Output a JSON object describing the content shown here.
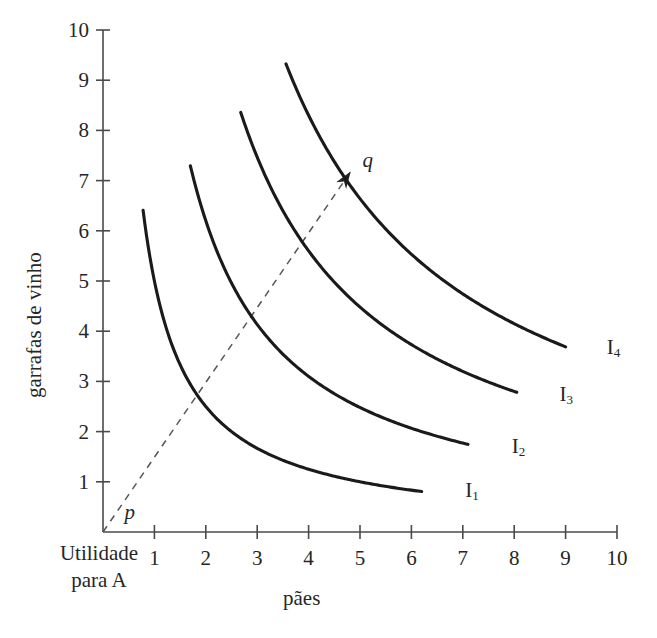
{
  "chart_data": {
    "type": "line",
    "title": "",
    "xlabel": "pães",
    "ylabel": "garrafas de vinho",
    "xlim": [
      0,
      10
    ],
    "ylim": [
      0,
      10
    ],
    "xticks": [
      1,
      2,
      3,
      4,
      5,
      6,
      7,
      8,
      9,
      10
    ],
    "yticks": [
      1,
      2,
      3,
      4,
      5,
      6,
      7,
      8,
      9,
      10
    ],
    "grid": false,
    "legend_position": "inline-right-of-curve",
    "series": [
      {
        "name": "I1",
        "label": "I",
        "sub": "1",
        "k": 5.0,
        "x_start": 0.78,
        "x_end": 6.2,
        "y_start": 6.41,
        "y_end": 0.81,
        "label_x": 7.05,
        "label_y": 0.78
      },
      {
        "name": "I2",
        "label": "I",
        "sub": "2",
        "k": 12.4,
        "x_start": 1.7,
        "x_end": 7.1,
        "y_start": 7.29,
        "y_end": 1.75,
        "label_x": 7.95,
        "label_y": 1.66
      },
      {
        "name": "I3",
        "label": "I",
        "sub": "3",
        "k": 22.4,
        "x_start": 2.68,
        "x_end": 8.05,
        "y_start": 8.36,
        "y_end": 2.78,
        "label_x": 8.88,
        "label_y": 2.68
      },
      {
        "name": "I4",
        "label": "I",
        "sub": "4",
        "k": 33.2,
        "x_start": 3.56,
        "x_end": 9.0,
        "y_start": 9.33,
        "y_end": 3.69,
        "label_x": 9.8,
        "label_y": 3.62
      }
    ],
    "annotations": [
      {
        "name": "utility-ray",
        "type": "dashed-arrow",
        "from": [
          0,
          0
        ],
        "to": [
          4.82,
          7.18
        ],
        "start_label": "p",
        "end_label": "q"
      }
    ],
    "origin_note": {
      "line1": "Utilidade",
      "line2": "para A"
    },
    "colors": {
      "curve": "#1a1a1a",
      "axis": "#4a4a4a",
      "dashed": "#555555",
      "text": "#262626",
      "background": "#ffffff"
    }
  },
  "labels": {
    "ylabel": "garrafas de vinho",
    "xlabel": "pães",
    "origin_line1": "Utilidade",
    "origin_line2": "para A",
    "ray_start": "p",
    "ray_end": "q",
    "curves": [
      "I",
      "I",
      "I",
      "I"
    ],
    "curve_subs": [
      "1",
      "2",
      "3",
      "4"
    ],
    "xticks": [
      "1",
      "2",
      "3",
      "4",
      "5",
      "6",
      "7",
      "8",
      "9",
      "10"
    ],
    "yticks": [
      "1",
      "2",
      "3",
      "4",
      "5",
      "6",
      "7",
      "8",
      "9",
      "10"
    ]
  }
}
